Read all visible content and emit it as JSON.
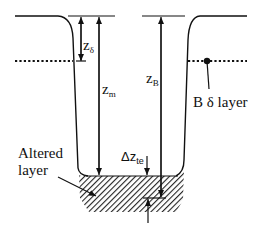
{
  "diagram": {
    "labels": {
      "z_delta": {
        "main": "z",
        "sub": "δ"
      },
      "z_m": {
        "main": "z",
        "sub": "m"
      },
      "z_B": {
        "main": "z",
        "sub": "B"
      },
      "delta_z_te": {
        "main": "Δz",
        "sub": "te"
      },
      "b_delta_layer": "B δ layer",
      "altered_layer_line1": "Altered",
      "altered_layer_line2": "layer"
    },
    "colors": {
      "line": "#111111",
      "background": "#ffffff",
      "hatch": "#222222"
    }
  }
}
